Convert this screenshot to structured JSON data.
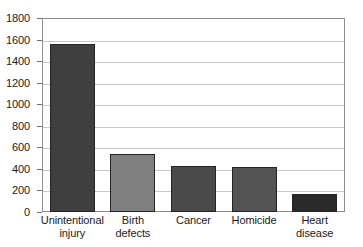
{
  "chart_data": {
    "type": "bar",
    "title": "",
    "subtitle": "",
    "xlabel": "",
    "ylabel": "",
    "categories": [
      "Unintentional injury",
      "Birth defects",
      "Cancer",
      "Homicide",
      "Heart disease"
    ],
    "category_lines": [
      [
        "Unintentional",
        "injury"
      ],
      [
        "Birth",
        "defects"
      ],
      [
        "Cancer",
        ""
      ],
      [
        "Homicide",
        ""
      ],
      [
        "Heart",
        "disease"
      ]
    ],
    "values": [
      1560,
      540,
      430,
      415,
      170
    ],
    "bar_colors": [
      "#3f3f3f",
      "#808080",
      "#4a4a4a",
      "#545454",
      "#2a2a2a"
    ],
    "ylim": [
      0,
      1800
    ],
    "yticks": [
      0,
      200,
      400,
      600,
      800,
      1000,
      1200,
      1400,
      1600,
      1800
    ],
    "ytick_labels": [
      "0",
      "200",
      "400",
      "600",
      "800",
      "1000",
      "1200",
      "1400",
      "1600",
      "1800"
    ],
    "grid": true,
    "grid_axis": "y",
    "legend": false,
    "legend_position": "none",
    "plot_background": "#ffffff",
    "frame_color": "#8d8d8d",
    "gridline_color": "#c8c8c8"
  }
}
